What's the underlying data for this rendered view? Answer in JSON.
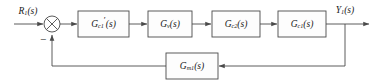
{
  "diagram": {
    "type": "control-system-block-diagram",
    "title": "",
    "width": 378,
    "height": 80,
    "colors": {
      "line": "#4a4a4a",
      "text": "#1a1a1a",
      "background": "#ffffff",
      "box_fill": "#fdfdfd"
    },
    "signals": {
      "input": {
        "base": "R",
        "sub": "1",
        "arg": "(s)",
        "full": "R1(s)"
      },
      "output": {
        "base": "Y",
        "sub": "1",
        "arg": "(s)",
        "full": "Y1(s)"
      }
    },
    "summing_junction": {
      "name": "summing-junction",
      "style": "circle-with-x",
      "positive_input": "R1(s)",
      "negative_input": "Gm1(s) feedback",
      "sign": "−"
    },
    "blocks": [
      {
        "id": "block-gc1-prime",
        "base": "G",
        "sub": "c1",
        "prime": "′",
        "arg": "(s)",
        "full": "G'c1(s)",
        "order": 1
      },
      {
        "id": "block-gv",
        "base": "G",
        "sub": "v",
        "prime": "",
        "arg": "(s)",
        "full": "Gv(s)",
        "order": 2
      },
      {
        "id": "block-gc2",
        "base": "G",
        "sub": "c2",
        "prime": "",
        "arg": "(s)",
        "full": "Gc2(s)",
        "order": 3
      },
      {
        "id": "block-gc1",
        "base": "G",
        "sub": "c1",
        "prime": "",
        "arg": "(s)",
        "full": "Gc1(s)",
        "order": 4
      }
    ],
    "feedback_block": {
      "id": "block-gm1",
      "base": "G",
      "sub": "m1",
      "prime": "",
      "arg": "(s)",
      "full": "Gm1(s)"
    },
    "paths": {
      "forward": "R1(s) → sum → G'c1(s) → Gv(s) → Gc2(s) → Gc1(s) → Y1(s)",
      "feedback": "Y1(s) → Gm1(s) → sum (negative)"
    }
  }
}
